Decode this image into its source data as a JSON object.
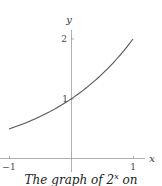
{
  "chart_data": {
    "type": "line",
    "title": "",
    "xlabel": "x",
    "ylabel": "y",
    "xlim": [
      -1.15,
      1.2
    ],
    "ylim": [
      0,
      2.2
    ],
    "x_ticks": [
      -1,
      1
    ],
    "x_tick_labels": [
      "−1",
      "1"
    ],
    "y_ticks": [
      1,
      2
    ],
    "y_tick_labels": [
      "1",
      "2"
    ],
    "grid": false,
    "legend": null,
    "series": [
      {
        "name": "2^x",
        "function": "2^x",
        "x": [
          -1,
          -0.75,
          -0.5,
          -0.25,
          0,
          0.25,
          0.5,
          0.75,
          1
        ],
        "values": [
          0.5,
          0.595,
          0.707,
          0.841,
          1,
          1.189,
          1.414,
          1.682,
          2
        ],
        "color": "#555555"
      }
    ],
    "caption": "The graph of 2^x on"
  },
  "caption": {
    "prefix": "The graph of 2",
    "sup": "x",
    "suffix": " on"
  },
  "labels": {
    "x_axis": "x",
    "y_axis": "y",
    "x_neg1": "−1",
    "x_pos1": "1",
    "y_1": "1",
    "y_2": "2"
  },
  "colors": {
    "axis": "#888888",
    "curve": "#555555",
    "text": "#333333"
  }
}
